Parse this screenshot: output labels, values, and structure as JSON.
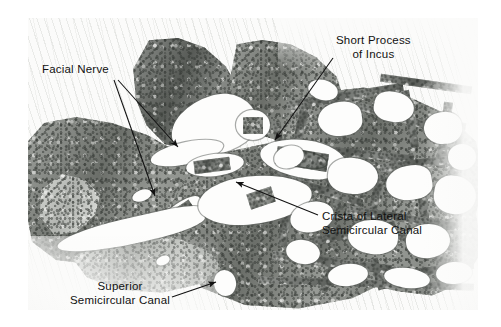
{
  "figure": {
    "kind": "histology-micrograph",
    "specimen": "temporal bone section",
    "plate": {
      "left": 28,
      "top": 18,
      "width": 450,
      "height": 292
    },
    "ink_color": "#111111",
    "tissue_color": "#8d918b",
    "lumen_color": "#fdfdfc"
  },
  "annotations": [
    {
      "id": "facial-nerve",
      "lines": [
        "Facial Nerve"
      ],
      "text_x": 42,
      "text_y": 62,
      "align": "left",
      "arrows": [
        {
          "x1": 118,
          "y1": 80,
          "x2": 178,
          "y2": 147
        },
        {
          "x1": 114,
          "y1": 80,
          "x2": 155,
          "y2": 196
        }
      ]
    },
    {
      "id": "short-process-of-incus",
      "lines": [
        "Short Process",
        "of Incus"
      ],
      "text_x": 336,
      "text_y": 33,
      "align": "center",
      "arrows": [
        {
          "x1": 333,
          "y1": 58,
          "x2": 275,
          "y2": 140
        }
      ]
    },
    {
      "id": "crista-of-lateral-semicircular-canal",
      "lines": [
        "Crista of Lateral",
        "Semicircular Canal"
      ],
      "text_x": 322,
      "text_y": 209,
      "align": "left",
      "arrows": [
        {
          "x1": 318,
          "y1": 215,
          "x2": 236,
          "y2": 182
        }
      ]
    },
    {
      "id": "superior-semicircular-canal",
      "lines": [
        "Superior",
        "Semicircular Canal"
      ],
      "text_x": 61,
      "text_y": 279,
      "align": "left",
      "arrows": [
        {
          "x1": 172,
          "y1": 297,
          "x2": 216,
          "y2": 282
        }
      ]
    }
  ]
}
